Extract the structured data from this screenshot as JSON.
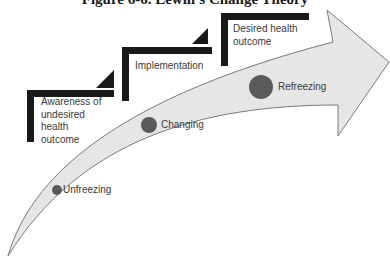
{
  "title": "Figure 6-6. Lewin's Change Theory",
  "steps": [
    {
      "label": "Awareness of undesired health outcome",
      "lines": [
        "Awareness of",
        "undesired",
        "health",
        "outcome"
      ]
    },
    {
      "label": "Implementation"
    },
    {
      "label": "Desired health outcome",
      "lines": [
        "Desired health",
        "outcome"
      ]
    }
  ],
  "stages": [
    {
      "label": "Unfreezing"
    },
    {
      "label": "Changing"
    },
    {
      "label": "Refreezing"
    }
  ],
  "colors": {
    "arrow_fill": "#e6e6e6",
    "arrow_stroke": "#7a7a7a",
    "stair": "#1a1a1a",
    "dot": "#5a5a5a"
  }
}
